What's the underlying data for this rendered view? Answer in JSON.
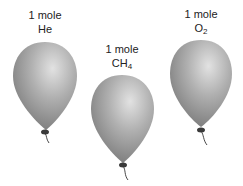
{
  "balloons": [
    {
      "amount": "1 mole",
      "formula": "He",
      "subscript": ""
    },
    {
      "amount": "1 mole",
      "formula": "CH",
      "subscript": "4"
    },
    {
      "amount": "1 mole",
      "formula": "O",
      "subscript": "2"
    }
  ],
  "colors": {
    "balloon_light": "#d6d6d6",
    "balloon_mid": "#a8a8a8",
    "balloon_dark": "#7d7d7d",
    "knot": "#3a3a3a",
    "string": "#333333"
  }
}
